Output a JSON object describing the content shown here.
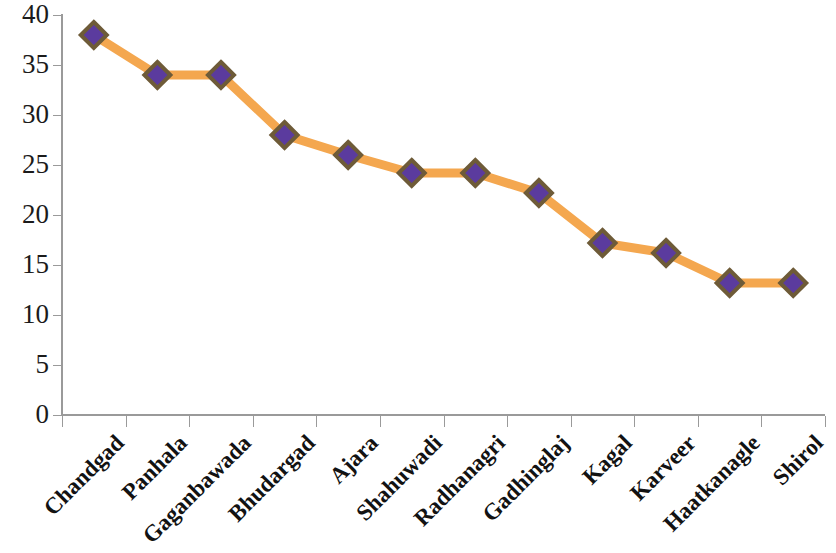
{
  "chart_data": {
    "type": "line",
    "title": "",
    "subtitle": "",
    "xlabel": "",
    "ylabel": "",
    "ylim": [
      0,
      40
    ],
    "ytick_step": 5,
    "yticks": [
      "0",
      "5",
      "10",
      "15",
      "20",
      "25",
      "30",
      "35",
      "40"
    ],
    "grid": false,
    "legend": "none",
    "categories": [
      "Chandgad",
      "Panhala",
      "Gaganbawada",
      "Bhudargad",
      "Ajara",
      "Shahuwadi",
      "Radhanagri",
      "Gadhinglaj",
      "Kagal",
      "Karveer",
      "Haatkanagle",
      "Shirol"
    ],
    "series": [
      {
        "name": "Series 1",
        "values": [
          38,
          34,
          34,
          28,
          26,
          24.2,
          24.2,
          22.2,
          17.2,
          16.2,
          13.2,
          13.2
        ],
        "line_color": "#F4A74F",
        "marker_shape": "diamond",
        "marker_fill": "#5B3B9E",
        "marker_border": "#6E5B38"
      }
    ],
    "axis_color": "#9a9a9a",
    "label_color": "#1b1b1b",
    "x_label_rotation_deg": -45,
    "background": "#ffffff"
  }
}
